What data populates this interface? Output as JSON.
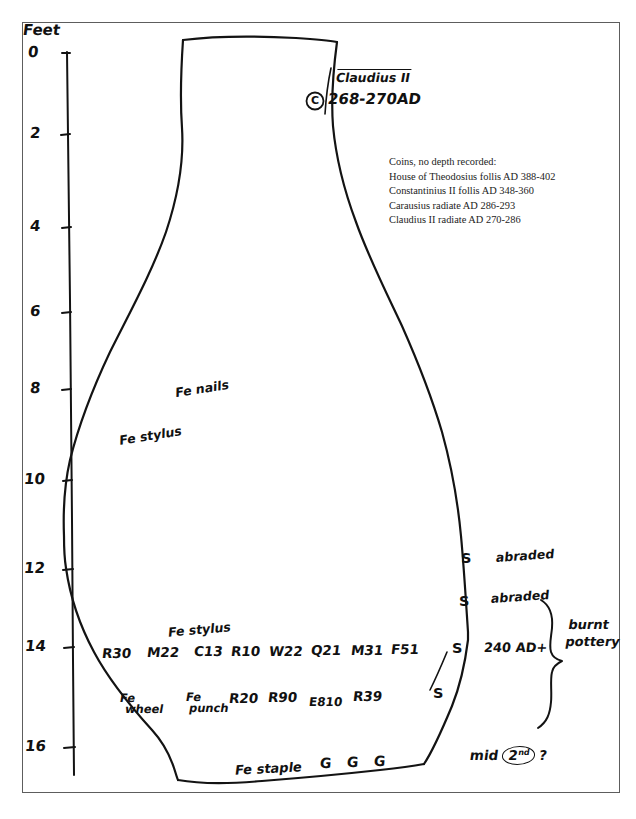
{
  "figure": {
    "kind": "archaeological-section-drawing",
    "axis": {
      "unit_label": "Feet",
      "ticks": [
        {
          "label": "0",
          "value": 0
        },
        {
          "label": "2",
          "value": 2
        },
        {
          "label": "4",
          "value": 4
        },
        {
          "label": "6",
          "value": 6
        },
        {
          "label": "8",
          "value": 8
        },
        {
          "label": "10",
          "value": 10
        },
        {
          "label": "12",
          "value": 12
        },
        {
          "label": "14",
          "value": 14
        },
        {
          "label": "16",
          "value": 16
        }
      ]
    },
    "coin_marker": {
      "symbol": "C",
      "name": "Claudius II",
      "date": "268-270AD"
    },
    "typed_note": {
      "heading": "Coins, no depth recorded:",
      "lines": [
        "House of Theodosius follis AD 388-402",
        "Constantinius II follis AD 348-360",
        "Carausius radiate AD 286-293",
        "Claudius II radiate AD 270-286"
      ]
    },
    "upper_annotations": [
      {
        "text": "Fe nails"
      },
      {
        "text": "Fe stylus"
      }
    ],
    "finds_row_1": {
      "stylus_label": "Fe stylus",
      "codes": [
        "R30",
        "M22",
        "C13",
        "R10",
        "W22",
        "Q21",
        "M31",
        "F51"
      ]
    },
    "finds_row_2": {
      "labels": [
        {
          "line1": "Fe",
          "line2": "wheel"
        },
        {
          "line1": "Fe",
          "line2": "punch"
        }
      ],
      "codes": [
        "R20",
        "R90",
        "E810",
        "R39"
      ]
    },
    "right_column": {
      "s_marks": [
        "S",
        "S",
        "S",
        "S"
      ],
      "notes": [
        "abraded",
        "abraded",
        "240 AD+"
      ],
      "brace_label_line1": "burnt",
      "brace_label_line2": "pottery"
    },
    "base_row": {
      "staple_label": "Fe staple",
      "g_marks": [
        "G",
        "G",
        "G"
      ],
      "date_note_prefix": "mid",
      "date_note_century": "2",
      "date_note_ordinal": "nd",
      "date_note_suffix": "?"
    },
    "colors": {
      "ink": "#131313",
      "frame": "#5d5d5d",
      "paper": "#ffffff"
    }
  }
}
